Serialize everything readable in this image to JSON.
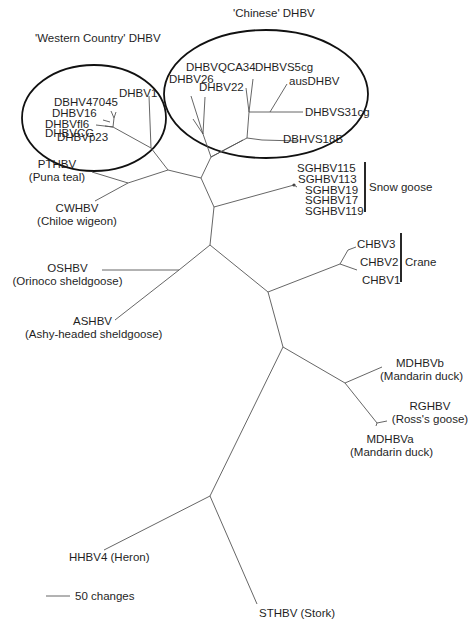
{
  "figure": {
    "type": "unrooted phylogenetic tree",
    "groups": {
      "western": "'Western Country' DHBV",
      "chinese": "'Chinese' DHBV",
      "snow_goose": "Snow goose",
      "crane": "Crane"
    },
    "western_taxa": [
      "DBHV47045",
      "DHBV16",
      "DHBVfl6",
      "DHBVCG",
      "DHBVp23"
    ],
    "western_dhbv1": "DHBV1",
    "chinese_taxa": {
      "qca34": "DHBVQCA34",
      "s5cg": "DHBVS5cg",
      "dhbv26": "DHBV26",
      "dhbv22": "DHBV22",
      "aus": "ausDHBV",
      "s31cg": "DHBVS31cg",
      "s18b": "DBHVS18B"
    },
    "snow_goose_taxa": [
      "SGHBV115",
      "SGHBV113",
      "SGHBV19",
      "SGHBV17",
      "SGHBV119"
    ],
    "crane_taxa": [
      "CHBV3",
      "CHBV2",
      "CHBV1"
    ],
    "single_taxa": {
      "pthbv": {
        "name": "PTHBV",
        "host": "(Puna teal)"
      },
      "cwhbv": {
        "name": "CWHBV",
        "host": "(Chiloe wigeon)"
      },
      "oshbv": {
        "name": "OSHBV",
        "host": "(Orinoco sheldgoose)"
      },
      "ashbv": {
        "name": "ASHBV",
        "host": "(Ashy-headed sheldgoose)"
      },
      "mdhbvb": {
        "name": "MDHBVb",
        "host": "(Mandarin duck)"
      },
      "rghbv": {
        "name": "RGHBV",
        "host": "(Ross's goose)"
      },
      "mdhbva": {
        "name": "MDHBVa",
        "host": "(Mandarin duck)"
      },
      "hhbv4": {
        "label": "HHBV4 (Heron)"
      },
      "sthbv": {
        "label": "STHBV (Stork)"
      }
    },
    "scale_bar": {
      "label": "50 changes"
    }
  }
}
